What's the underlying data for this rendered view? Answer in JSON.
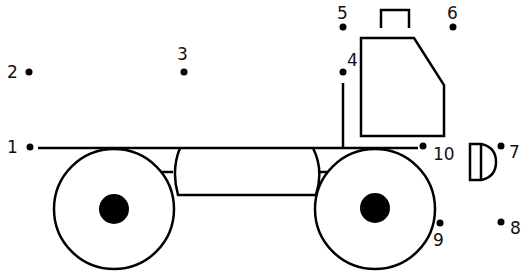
{
  "colors": {
    "stroke": "#000000",
    "background": "#ffffff"
  },
  "dots": [
    {
      "n": "1",
      "x": 30,
      "y": 147,
      "lx": 7,
      "ly": 153
    },
    {
      "n": "2",
      "x": 29,
      "y": 72,
      "lx": 7,
      "ly": 78
    },
    {
      "n": "3",
      "x": 184,
      "y": 72,
      "lx": 177,
      "ly": 60
    },
    {
      "n": "4",
      "x": 343,
      "y": 72,
      "lx": 347,
      "ly": 66
    },
    {
      "n": "5",
      "x": 343,
      "y": 27,
      "lx": 337,
      "ly": 19
    },
    {
      "n": "6",
      "x": 453,
      "y": 27,
      "lx": 447,
      "ly": 19
    },
    {
      "n": "7",
      "x": 501,
      "y": 146,
      "lx": 509,
      "ly": 158
    },
    {
      "n": "8",
      "x": 501,
      "y": 222,
      "lx": 510,
      "ly": 234
    },
    {
      "n": "9",
      "x": 440,
      "y": 223,
      "lx": 433,
      "ly": 246
    },
    {
      "n": "10",
      "x": 423,
      "y": 146,
      "lx": 433,
      "ly": 160
    }
  ]
}
